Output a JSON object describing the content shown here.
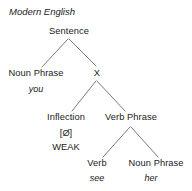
{
  "figure": {
    "caption": "Modern English",
    "nodes": {
      "sentence": "Sentence",
      "noun_phrase_subject": "Noun Phrase",
      "x": "X",
      "inflection": "Inflection",
      "verb_phrase": "Verb Phrase",
      "verb": "Verb",
      "noun_phrase_object": "Noun Phrase"
    },
    "features": {
      "inflection_zero": "[Ø]",
      "inflection_strength": "WEAK"
    },
    "glosses": {
      "subject": "you",
      "verb": "see",
      "object": "her"
    },
    "colors": {
      "text": "#1a1a1a",
      "branch": "#7a7a7a",
      "background": "#ffffff"
    }
  }
}
